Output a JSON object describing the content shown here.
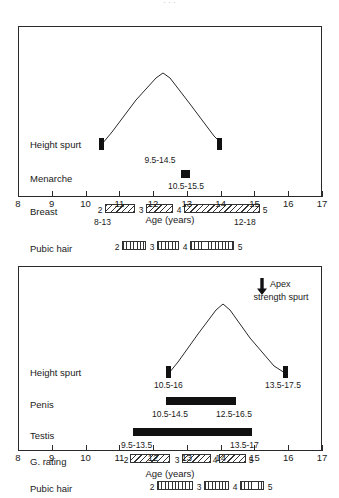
{
  "figure": {
    "partial_header": ". . ."
  },
  "axis": {
    "title": "Age (years)",
    "ticks": [
      8,
      9,
      10,
      11,
      12,
      13,
      14,
      15,
      16,
      17
    ],
    "min": 8,
    "max": 17
  },
  "charts": [
    {
      "id": "girls",
      "rows": [
        {
          "label": "Height spurt",
          "type": "spurt",
          "start": 10.5,
          "end": 14.0,
          "range_label": "9.5-14.5",
          "range_center": 12.2
        },
        {
          "label": "Menarche",
          "type": "point",
          "at": 13.0,
          "range_label": "10.5-15.5",
          "range_center": 13.0
        },
        {
          "label": "Breast",
          "type": "stages",
          "left_label": "8-13",
          "right_label": "12-18",
          "stages": [
            {
              "num": "2",
              "start": 10.85,
              "end": 11.75
            },
            {
              "num": "3",
              "start": 12.1,
              "end": 12.9
            },
            {
              "num": "4",
              "start": 13.25,
              "end": 14.55
            },
            {
              "num": "5",
              "start": 14.55,
              "end": 14.55
            }
          ]
        },
        {
          "label": "Pubic hair",
          "type": "stages",
          "left_label": "",
          "right_label": "",
          "stages": [
            {
              "num": "2",
              "start": 11.3,
              "end": 12.0
            },
            {
              "num": "3",
              "start": 12.35,
              "end": 13.0
            },
            {
              "num": "4",
              "start": 13.3,
              "end": 14.6
            },
            {
              "num": "5",
              "start": 14.6,
              "end": 14.6
            }
          ]
        }
      ]
    },
    {
      "id": "boys",
      "rows": [
        {
          "label": "Height spurt",
          "type": "spurt",
          "start": 12.4,
          "end": 15.9,
          "left_range_label": "10.5-16",
          "right_range_label": "13.5-17.5"
        },
        {
          "label": "Penis",
          "type": "solid",
          "start": 12.4,
          "end": 14.5,
          "left_range_label": "10.5-14.5",
          "right_range_label": "12.5-16.5"
        },
        {
          "label": "Testis",
          "type": "solid",
          "start": 11.4,
          "end": 14.95,
          "left_range_label": "9.5-13.5",
          "right_range_label": "13.5-17"
        },
        {
          "label": "G. rating",
          "type": "stages",
          "stages": [
            {
              "num": "2",
              "start": 11.6,
              "end": 12.8
            },
            {
              "num": "3",
              "start": 13.15,
              "end": 14.0
            },
            {
              "num": "4",
              "start": 14.3,
              "end": 15.1
            },
            {
              "num": "5",
              "start": 15.1,
              "end": 15.1
            }
          ]
        },
        {
          "label": "Pubic hair",
          "type": "stages",
          "stages": [
            {
              "num": "2",
              "start": 12.35,
              "end": 13.4
            },
            {
              "num": "3",
              "start": 13.75,
              "end": 14.5
            },
            {
              "num": "4",
              "start": 14.85,
              "end": 15.55
            },
            {
              "num": "5",
              "start": 15.55,
              "end": 15.55
            }
          ]
        }
      ],
      "annotation": {
        "line1": "Apex",
        "line2": "strength spurt",
        "icon": "down-arrow-icon"
      }
    }
  ],
  "chart_data": {
    "type": "table",
    "xlabel": "Age (years)",
    "xlim": [
      8,
      17
    ],
    "grid": false,
    "legend": "none",
    "panels": [
      {
        "name": "Girls",
        "events": [
          {
            "event": "Height spurt",
            "range_text": "9.5-14.5",
            "onset_marker_age": 10.5,
            "offset_marker_age": 14.0,
            "peak_age": 12.0
          },
          {
            "event": "Menarche",
            "range_text": "10.5-15.5",
            "marker_age": 13.0
          },
          {
            "event": "Breast",
            "onset_range_text": "8-13",
            "completion_range_text": "12-18",
            "stages": [
              "2",
              "3",
              "4",
              "5"
            ]
          },
          {
            "event": "Pubic hair",
            "stages": [
              "2",
              "3",
              "4",
              "5"
            ]
          }
        ]
      },
      {
        "name": "Boys",
        "events": [
          {
            "event": "Height spurt",
            "onset_range_text": "10.5-16",
            "offset_range_text": "13.5-17.5",
            "onset_marker_age": 12.5,
            "offset_marker_age": 16.0,
            "peak_age": 14.0
          },
          {
            "event": "Penis",
            "onset_range_text": "10.5-14.5",
            "offset_range_text": "12.5-16.5",
            "bar_start_age": 12.4,
            "bar_end_age": 14.5
          },
          {
            "event": "Testis",
            "onset_range_text": "9.5-13.5",
            "offset_range_text": "13.5-17",
            "bar_start_age": 11.4,
            "bar_end_age": 14.95
          },
          {
            "event": "G. rating",
            "stages": [
              "2",
              "3",
              "4",
              "5"
            ]
          },
          {
            "event": "Pubic hair",
            "stages": [
              "2",
              "3",
              "4",
              "5"
            ]
          }
        ],
        "annotation": "Apex strength spurt"
      }
    ]
  }
}
